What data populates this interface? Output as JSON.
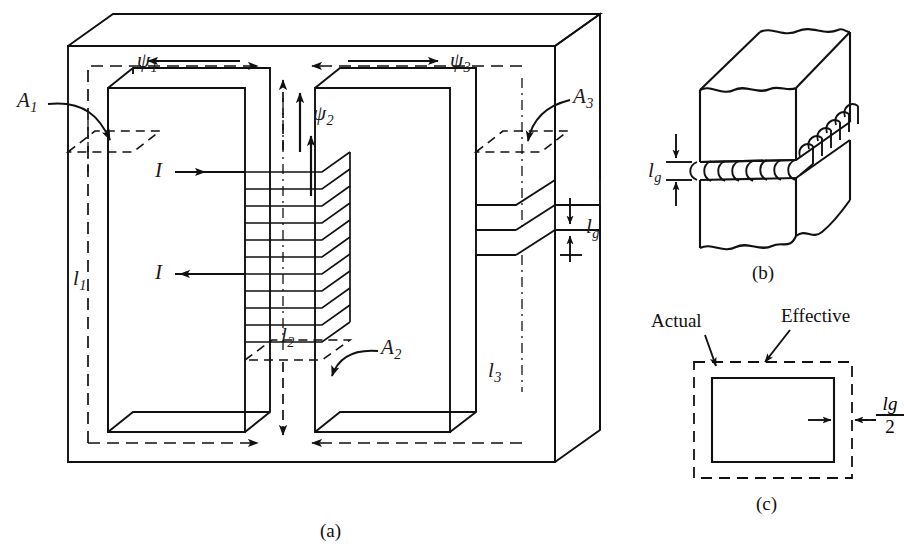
{
  "figure": {
    "panels": [
      {
        "id": "a",
        "caption": "(a)",
        "description": "Three-legged magnetic core, cut-away isometric view with coil on center leg and air gap in right leg"
      },
      {
        "id": "b",
        "caption": "(b)",
        "description": "Close-up isometric of air gap showing fringing flux bulging outward"
      },
      {
        "id": "c",
        "caption": "(c)",
        "description": "Gap cross section: actual area versus effective area enlarged by lg/2 on each side"
      }
    ]
  },
  "panel_a": {
    "flux_labels": [
      {
        "name": "psi1",
        "text": "ψ",
        "sub": "1"
      },
      {
        "name": "psi2",
        "text": "ψ",
        "sub": "2"
      },
      {
        "name": "psi3",
        "text": "ψ",
        "sub": "3"
      }
    ],
    "area_labels": [
      {
        "name": "A1",
        "text": "A",
        "sub": "1"
      },
      {
        "name": "A2",
        "text": "A",
        "sub": "2"
      },
      {
        "name": "A3",
        "text": "A",
        "sub": "3"
      }
    ],
    "length_labels": [
      {
        "name": "l1",
        "text": "l",
        "sub": "1"
      },
      {
        "name": "l2",
        "text": "l",
        "sub": "2"
      },
      {
        "name": "l3",
        "text": "l",
        "sub": "3"
      }
    ],
    "current_labels": [
      {
        "name": "current-top",
        "text": "I"
      },
      {
        "name": "current-bottom",
        "text": "I"
      }
    ],
    "gap_label": {
      "name": "lg",
      "text": "l",
      "sub": "g"
    },
    "caption": "(a)"
  },
  "panel_b": {
    "gap_label": {
      "name": "lg",
      "text": "l",
      "sub": "g"
    },
    "caption": "(b)"
  },
  "panel_c": {
    "actual_label": "Actual",
    "effective_label": "Effective",
    "gap_fraction": {
      "numerator_symbol": "l",
      "numerator_sub": "g",
      "denominator": "2"
    },
    "caption": "(c)"
  },
  "style": {
    "line_color": "#111111",
    "background": "#ffffff",
    "stroke_width": 1.8
  }
}
